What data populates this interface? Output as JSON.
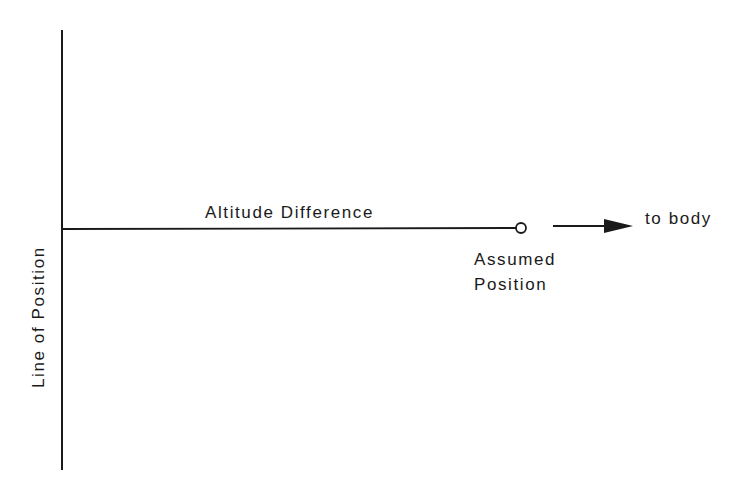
{
  "diagram": {
    "type": "navigation-line-of-position",
    "colors": {
      "background": "#ffffff",
      "ink": "#1a1a1a"
    },
    "labels": {
      "line_of_position": "Line of Position",
      "altitude_difference": "Altitude Difference",
      "assumed_position_line1": "Assumed",
      "assumed_position_line2": "Position",
      "to_body": "to body"
    },
    "elements": {
      "line_of_position": {
        "orientation": "vertical",
        "x": 62,
        "y1": 30,
        "y2": 470
      },
      "altitude_difference_line": {
        "orientation": "horizontal",
        "y": 229,
        "x1": 62,
        "x2": 516
      },
      "assumed_position_marker": {
        "shape": "circle",
        "cx": 521,
        "cy": 228,
        "r": 5
      },
      "direction_arrow": {
        "x1": 553,
        "x2": 632,
        "y": 226,
        "points_to": "to body"
      }
    }
  }
}
